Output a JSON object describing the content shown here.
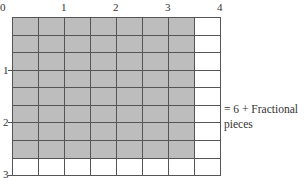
{
  "diagram": {
    "type": "area-model-grid",
    "grid": {
      "columns": 8,
      "rows": 9,
      "shaded_columns": 7,
      "shaded_rows": 8
    },
    "colors": {
      "shade": "#bdbdbd",
      "line": "#555555",
      "background": "#ffffff"
    },
    "top_axis_labels": [
      "0",
      "1",
      "2",
      "3",
      "4"
    ],
    "left_axis_labels": [
      "1",
      "2",
      "3"
    ],
    "annotation": {
      "line1": "= 6 + Fractional",
      "line2": "pieces"
    }
  }
}
